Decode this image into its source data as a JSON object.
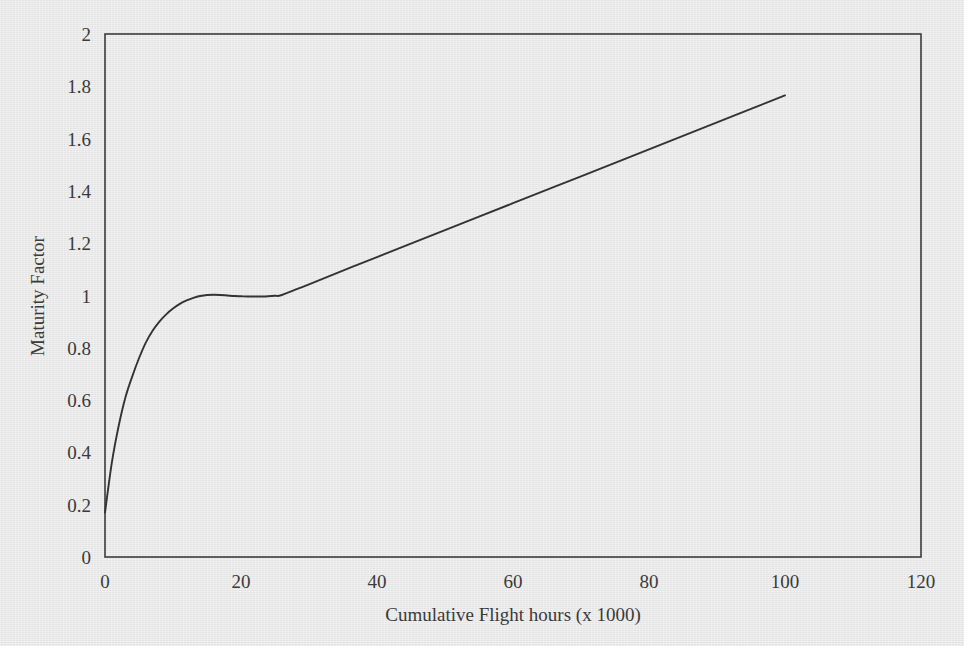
{
  "chart_data": {
    "type": "line",
    "title": "",
    "xlabel": "Cumulative Flight hours (x 1000)",
    "ylabel": "Maturity Factor",
    "xlim": [
      0,
      120
    ],
    "ylim": [
      0,
      2
    ],
    "xticks": [
      0,
      20,
      40,
      60,
      80,
      100,
      120
    ],
    "yticks": [
      0,
      0.2,
      0.4,
      0.6,
      0.8,
      1,
      1.2,
      1.4,
      1.6,
      1.8,
      2
    ],
    "xtick_labels": [
      "0",
      "20",
      "40",
      "60",
      "80",
      "100",
      "120"
    ],
    "ytick_labels": [
      "0",
      "0.2",
      "0.4",
      "0.6",
      "0.8",
      "1",
      "1.2",
      "1.4",
      "1.6",
      "1.8",
      "2"
    ],
    "grid": false,
    "legend": null,
    "line_color": "#333333",
    "series": [
      {
        "name": "Maturity Factor",
        "x": [
          0,
          1,
          2,
          3,
          4,
          5,
          6,
          7,
          8,
          9,
          10,
          11,
          12,
          13,
          14,
          15,
          16,
          17,
          18,
          19,
          20,
          21,
          22,
          23,
          24,
          25,
          26,
          30,
          40,
          50,
          60,
          70,
          80,
          90,
          100
        ],
        "y": [
          0.17,
          0.36,
          0.5,
          0.61,
          0.69,
          0.76,
          0.82,
          0.865,
          0.9,
          0.928,
          0.95,
          0.968,
          0.981,
          0.991,
          0.998,
          1.002,
          1.003,
          1.002,
          1.0,
          0.998,
          0.997,
          0.996,
          0.996,
          0.996,
          0.997,
          0.999,
          1.002,
          1.043,
          1.147,
          1.25,
          1.353,
          1.456,
          1.559,
          1.662,
          1.765
        ]
      }
    ]
  },
  "axes": {
    "y_title": "Maturity Factor",
    "x_title": "Cumulative Flight hours (x 1000)"
  }
}
